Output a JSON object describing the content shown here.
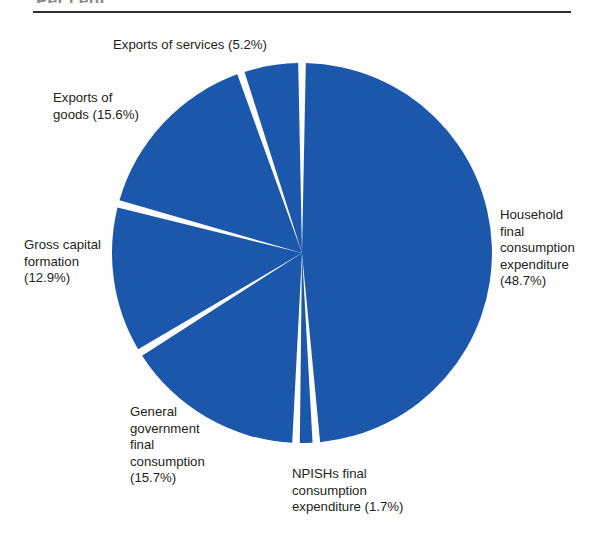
{
  "header": {
    "clipped_title": "Per cent",
    "rule_color": "#2f2f2f"
  },
  "colors": {
    "slice_blue": "#1b58ab",
    "separator": "#ffffff",
    "text": "#231f20"
  },
  "labels": {
    "exports_services": "Exports of services (5.2%)",
    "exports_goods": "Exports of\ngoods (15.6%)",
    "gross_capital": "Gross capital\nformation\n(12.9%)",
    "general_government": "General\ngovernment\nfinal\nconsumption\n(15.7%)",
    "npishs": "NPISHs final\nconsumption\nexpenditure (1.7%)",
    "household": "Household\nfinal\nconsumption\nexpenditure\n(48.7%)"
  },
  "chart_data": {
    "type": "pie",
    "title": "Per cent",
    "xlabel": "",
    "ylabel": "",
    "unit": "percent",
    "start_angle_deg": 0,
    "direction": "clockwise",
    "legend": "none (direct labels)",
    "grid": false,
    "categories": [
      "Household final consumption expenditure",
      "NPISHs final consumption expenditure",
      "General government final consumption",
      "Gross capital formation",
      "Exports of goods",
      "Exports of services"
    ],
    "values": [
      48.7,
      1.7,
      15.7,
      12.9,
      15.6,
      5.2
    ],
    "slices": [
      {
        "label": "Household final consumption expenditure",
        "value": 48.7,
        "color": "#1b58ab",
        "label_text": "Household\nfinal\nconsumption\nexpenditure\n(48.7%)"
      },
      {
        "label": "NPISHs final consumption expenditure",
        "value": 1.7,
        "color": "#1b58ab",
        "label_text": "NPISHs final\nconsumption\nexpenditure (1.7%)"
      },
      {
        "label": "General government final consumption",
        "value": 15.7,
        "color": "#1b58ab",
        "label_text": "General\ngovernment\nfinal\nconsumption\n(15.7%)"
      },
      {
        "label": "Gross capital formation",
        "value": 12.9,
        "color": "#1b58ab",
        "label_text": "Gross capital\nformation\n(12.9%)"
      },
      {
        "label": "Exports of goods",
        "value": 15.6,
        "color": "#1b58ab",
        "label_text": "Exports of\ngoods (15.6%)"
      },
      {
        "label": "Exports of services",
        "value": 5.2,
        "color": "#1b58ab",
        "label_text": "Exports of services (5.2%)"
      }
    ],
    "total": 99.8
  }
}
